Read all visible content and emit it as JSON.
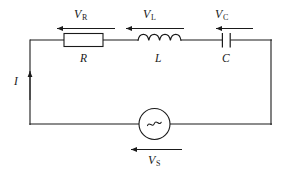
{
  "figure": {
    "type": "circuit-diagram",
    "background_color": "#ffffff",
    "line_color": "#1a1a1a"
  },
  "components": [
    {
      "id": "resistor",
      "symbol_name": "resistor-rectangle",
      "label": "R",
      "voltage_label_base": "V",
      "voltage_label_sub": "R"
    },
    {
      "id": "inductor",
      "symbol_name": "inductor-coil",
      "label": "L",
      "voltage_label_base": "V",
      "voltage_label_sub": "L"
    },
    {
      "id": "capacitor",
      "symbol_name": "capacitor-plates",
      "label": "C",
      "voltage_label_base": "V",
      "voltage_label_sub": "C"
    },
    {
      "id": "source",
      "symbol_name": "ac-source-circle",
      "glyph": "∼",
      "label": "",
      "voltage_label_base": "V",
      "voltage_label_sub": "S"
    }
  ],
  "current": {
    "label": "I",
    "direction": "up"
  },
  "arrows": {
    "vr": "left",
    "vl": "left",
    "vc": "left",
    "vs": "left"
  }
}
